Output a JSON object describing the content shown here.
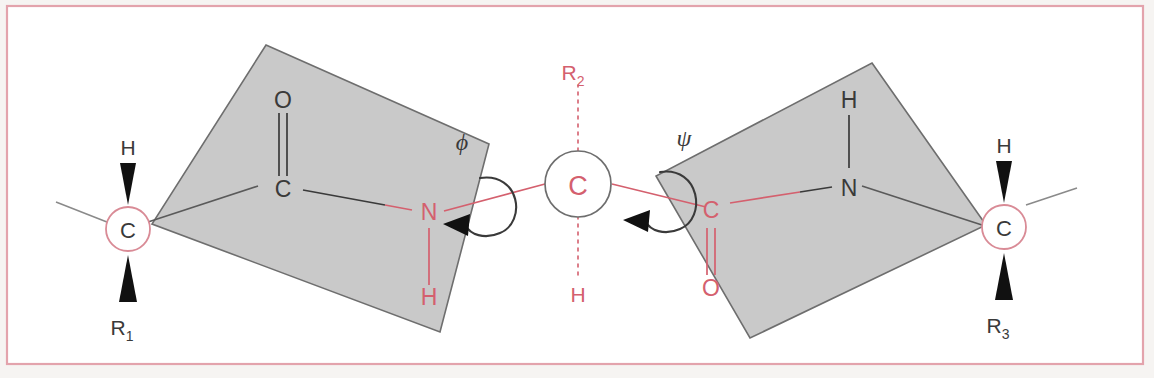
{
  "figure": {
    "background_color": "#f6f4f2",
    "canvas_color": "#ffffff",
    "frame_color": "#e3a3ac",
    "plane_fill": "#c9c9c9",
    "plane_stroke": "#6e6e6e",
    "red": "#d4606e",
    "dark": "#3a3a3a"
  },
  "atoms": {
    "left_alpha_carbon": {
      "label": "C",
      "circle_color": "#d98b96",
      "label_color": "#3a3a3a"
    },
    "left_carbonyl_carbon": {
      "label": "C",
      "color": "#3a3a3a"
    },
    "left_carbonyl_oxygen": {
      "label": "O",
      "color": "#3a3a3a"
    },
    "left_amide_nitrogen": {
      "label": "N",
      "color": "#d4606e"
    },
    "left_amide_hydrogen": {
      "label": "H",
      "color": "#d4606e"
    },
    "central_alpha_carbon": {
      "label": "C",
      "circle_color": "#6e6e6e",
      "label_color": "#d4606e"
    },
    "right_carbonyl_carbon": {
      "label": "C",
      "color": "#d4606e"
    },
    "right_carbonyl_oxygen": {
      "label": "O",
      "color": "#d4606e"
    },
    "right_amide_nitrogen": {
      "label": "N",
      "color": "#3a3a3a"
    },
    "right_amide_hydrogen": {
      "label": "H",
      "color": "#3a3a3a"
    },
    "right_alpha_carbon": {
      "label": "C",
      "circle_color": "#d98b96",
      "label_color": "#3a3a3a"
    }
  },
  "substituents": {
    "left_hydrogen": {
      "label": "H",
      "color": "#3a3a3a"
    },
    "left_r_group": {
      "label": "R",
      "subscript": "1",
      "color": "#3a3a3a"
    },
    "center_r_group": {
      "label": "R",
      "subscript": "2",
      "color": "#d4606e"
    },
    "center_hydrogen": {
      "label": "H",
      "color": "#d4606e"
    },
    "right_hydrogen": {
      "label": "H",
      "color": "#3a3a3a"
    },
    "right_r_group": {
      "label": "R",
      "subscript": "3",
      "color": "#3a3a3a"
    }
  },
  "angles": {
    "phi": {
      "symbol": "ϕ",
      "name": "phi",
      "color": "#3a3a3a"
    },
    "psi": {
      "symbol": "ψ",
      "name": "psi",
      "color": "#3a3a3a"
    }
  }
}
